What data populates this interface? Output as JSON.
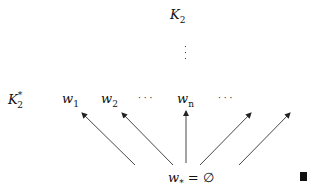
{
  "diagram": {
    "top_node": {
      "base": "K",
      "sub": "2"
    },
    "vdots": "⋮",
    "row_label": {
      "base": "K",
      "sub": "2",
      "sup": "*"
    },
    "row_nodes": [
      {
        "base": "w",
        "sub": "1"
      },
      {
        "base": "w",
        "sub": "2"
      },
      {
        "text": "· · ·"
      },
      {
        "base": "w",
        "sub": "n"
      },
      {
        "text": "· · ·"
      }
    ],
    "bottom_node": {
      "base": "w",
      "sub": "*",
      "rest": " = ∅"
    },
    "end_mark": "qed-square"
  }
}
